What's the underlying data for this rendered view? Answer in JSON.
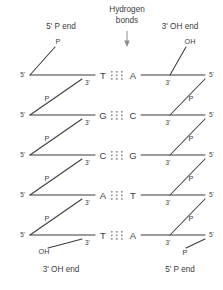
{
  "figure": {
    "title_top_left": "5' P end",
    "title_top_right": "3' OH end",
    "title_bottom_left": "3' OH end",
    "title_bottom_right": "5' P end",
    "hydrogen_bonds_label_line1": "Hydrogen",
    "hydrogen_bonds_label_line2": "bonds",
    "ink_color": "#3c3c3c",
    "dot_color": "#8d8d8d",
    "background": "#ffffff"
  },
  "labels": {
    "five_prime": "5'",
    "three_prime": "3'",
    "phosphate": "P",
    "hydroxyl": "OH"
  },
  "base_pairs": [
    {
      "left": "T",
      "right": "A",
      "bonds": 3
    },
    {
      "left": "G",
      "right": "C",
      "bonds": 3
    },
    {
      "left": "C",
      "right": "G",
      "bonds": 3
    },
    {
      "left": "A",
      "right": "T",
      "bonds": 3
    },
    {
      "left": "T",
      "right": "A",
      "bonds": 3
    }
  ],
  "strand_left": {
    "direction": "5' to 3' downward",
    "top_terminus": "P",
    "bottom_terminus": "OH",
    "linker_groups": [
      "P",
      "P",
      "P",
      "P"
    ]
  },
  "strand_right": {
    "direction": "3' to 5' downward",
    "top_terminus": "OH",
    "bottom_terminus": "P",
    "linker_groups": [
      "P",
      "P",
      "P",
      "P"
    ]
  }
}
